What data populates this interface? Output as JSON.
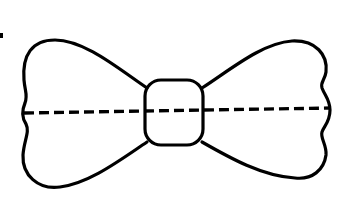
{
  "figure": {
    "fold_line": "dashed",
    "colors": {
      "stroke": "#000000",
      "background": "#ffffff"
    }
  }
}
